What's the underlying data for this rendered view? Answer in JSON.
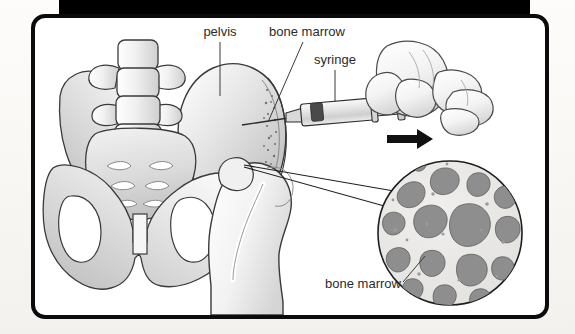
{
  "figure": {
    "background_color": "#fbfaf8",
    "frame_color": "#0b0b0b",
    "panel_color": "#ffffff",
    "top_band_color": "#000000",
    "labels": [
      {
        "id": "pelvis",
        "text": "pelvis",
        "x": 206,
        "y": 28
      },
      {
        "id": "bone-marrow-top",
        "text": "bone marrow",
        "x": 296,
        "y": 28
      },
      {
        "id": "syringe",
        "text": "syringe",
        "x": 348,
        "y": 55
      },
      {
        "id": "bone-marrow-bottom",
        "text": "bone marrow",
        "x": 355,
        "y": 276
      }
    ],
    "colors": {
      "bone_outline": "#3a3a3a",
      "bone_light": "#f4f4f4",
      "bone_mid": "#d6d6d6",
      "bone_shadow": "#b4b4b4",
      "marrow_cavity": "#8e8e8e",
      "trabecular_matrix": "#e8e8e6",
      "syringe_barrel": "#e2e2e2",
      "syringe_stopper": "#4a4a4a",
      "skin_light": "#fafafa",
      "skin_shade": "#dcdcdc",
      "arrow": "#111111",
      "leader_line": "#3a3a3a"
    },
    "parts": [
      "lumbar vertebrae",
      "sacrum",
      "iliac crest",
      "obturator foramen",
      "pubic symphysis",
      "femoral head",
      "greater trochanter",
      "syringe barrel",
      "syringe plunger",
      "needle",
      "hand",
      "magnification circle",
      "direction arrow"
    ]
  }
}
